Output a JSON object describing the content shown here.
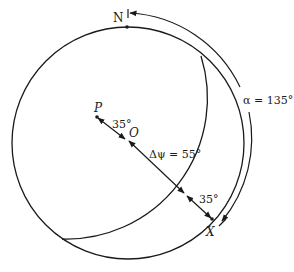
{
  "diagram": {
    "type": "spherical-geometry",
    "points": {
      "N": {
        "label": "N"
      },
      "P": {
        "label": "P"
      },
      "O": {
        "label": "O"
      },
      "X": {
        "label": "X"
      }
    },
    "labels": {
      "angle_po": "35°",
      "delta_psi": "Δψ = 55°",
      "angle_x": "35°",
      "alpha": "α = 135°"
    },
    "colors": {
      "stroke": "#1a1a1a",
      "background": "#ffffff"
    }
  }
}
